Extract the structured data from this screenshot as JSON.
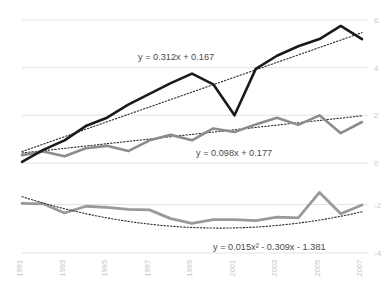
{
  "chart_data": {
    "type": "line",
    "title": "",
    "xlabel": "",
    "ylabel": "",
    "grid": true,
    "legend_position": "none",
    "panels": [
      {
        "name": "upper-panel",
        "ylim": [
          0,
          6
        ],
        "yticks": [
          0,
          2,
          4,
          6
        ],
        "ytick_labels": [
          "0",
          "2",
          "4",
          "6"
        ],
        "yaxis_side": "right",
        "x": [
          1991,
          1992,
          1993,
          1994,
          1995,
          1996,
          1997,
          1998,
          1999,
          2000,
          2001,
          2002,
          2003,
          2004,
          2005,
          2006,
          2007
        ],
        "series": [
          {
            "name": "dark-series",
            "color": "#1a1a1a",
            "style": "solid",
            "width": 2.6,
            "values": [
              0.05,
              0.55,
              0.95,
              1.55,
              1.9,
              2.45,
              2.9,
              3.35,
              3.75,
              3.3,
              2.0,
              3.95,
              4.5,
              4.9,
              5.2,
              5.75,
              5.2
            ]
          },
          {
            "name": "dark-trendline",
            "color": "#2b2b2b",
            "style": "dotted",
            "width": 1.1,
            "equation": "y = 0.312x + 0.167",
            "equation_label": "y = 0.312x + 0.167",
            "slope": 0.312,
            "intercept": 0.167,
            "endpoints": [
              0.48,
              5.47
            ]
          },
          {
            "name": "gray-series",
            "color": "#8c8c8c",
            "style": "solid",
            "width": 2.6,
            "values": [
              0.33,
              0.48,
              0.28,
              0.62,
              0.72,
              0.5,
              0.95,
              1.18,
              0.95,
              1.45,
              1.3,
              1.62,
              1.9,
              1.6,
              2.0,
              1.25,
              1.72
            ]
          },
          {
            "name": "gray-trendline",
            "color": "#2b2b2b",
            "style": "dotted",
            "width": 1.1,
            "equation": "y = 0.098x + 0.177",
            "equation_label": "y = 0.098x + 0.177",
            "slope": 0.098,
            "intercept": 0.177,
            "endpoints": [
              0.42,
              1.98
            ]
          }
        ]
      },
      {
        "name": "lower-panel",
        "ylim": [
          -4,
          -1.4
        ],
        "yticks": [
          -2,
          -4
        ],
        "ytick_labels": [
          "-2",
          "-4"
        ],
        "yaxis_side": "right",
        "x": [
          1991,
          1992,
          1993,
          1994,
          1995,
          1996,
          1997,
          1998,
          1999,
          2000,
          2001,
          2002,
          2003,
          2004,
          2005,
          2006,
          2007
        ],
        "series": [
          {
            "name": "residual-series",
            "color": "#9a9a9a",
            "style": "solid",
            "width": 2.8,
            "values": [
              -1.95,
              -1.97,
              -2.35,
              -2.07,
              -2.12,
              -2.2,
              -2.22,
              -2.58,
              -2.78,
              -2.62,
              -2.62,
              -2.66,
              -2.52,
              -2.55,
              -1.5,
              -2.38,
              -2.02
            ]
          },
          {
            "name": "poly-trendline",
            "color": "#2b2b2b",
            "style": "dotted",
            "width": 1.1,
            "equation": "y = 0.015x² - 0.309x - 1.381",
            "equation_label": "y = 0.015x² - 0.309x - 1.381",
            "a": 0.015,
            "b": -0.309,
            "c": -1.381
          }
        ]
      }
    ],
    "xtick_labels": [
      "1991",
      "1993",
      "1995",
      "1997",
      "1999",
      "2001",
      "2003",
      "2005",
      "2007"
    ],
    "xtick_years": [
      1991,
      1993,
      1995,
      1997,
      1999,
      2001,
      2003,
      2005,
      2007
    ],
    "colors": {
      "dark_line": "#1a1a1a",
      "gray_line": "#8c8c8c",
      "trend_line": "#2b2b2b",
      "gridline": "#e3e3e3",
      "tick_text": "#c3c3c3",
      "equation_text": "#4a4a4a",
      "background": "#ffffff"
    }
  }
}
